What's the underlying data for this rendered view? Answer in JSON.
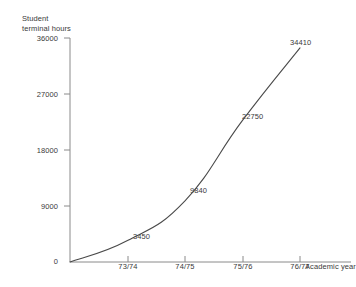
{
  "chart_data": {
    "type": "line",
    "title": "",
    "xlabel": "Academic year",
    "ylabel": "Student\nterminal hours",
    "categories": [
      "",
      "73/74",
      "74/75",
      "75/76",
      "76/77"
    ],
    "x": [
      "72/73",
      "73/74",
      "74/75",
      "75/76",
      "76/77"
    ],
    "values": [
      0,
      3450,
      9840,
      22750,
      34410
    ],
    "point_labels": [
      "0",
      "3450",
      "9840",
      "22750",
      "34410"
    ],
    "ylim": [
      0,
      36000
    ],
    "y_ticks": [
      0,
      9000,
      18000,
      27000,
      36000
    ],
    "y_tick_labels": [
      "0",
      "9000",
      "18000",
      "27000",
      "36000"
    ],
    "x_tick_labels": [
      "73/74",
      "74/75",
      "75/76",
      "76/77"
    ],
    "grid": false,
    "legend": false,
    "series": [
      {
        "name": "Student terminal hours",
        "values": [
          0,
          3450,
          9840,
          22750,
          34410
        ]
      }
    ],
    "line_color": "#4a4a4a",
    "axis_color": "#8a8a8a",
    "text_color": "#3a3a3a"
  },
  "y_axis": {
    "title_line1": "Student",
    "title_line2": "terminal hours",
    "title": "Student\nterminal hours",
    "ticks": [
      {
        "label": "36000"
      },
      {
        "label": "27000"
      },
      {
        "label": "18000"
      },
      {
        "label": "9000"
      },
      {
        "label": "0"
      }
    ]
  },
  "x_axis": {
    "title": "Academic year",
    "ticks": [
      {
        "label": "73/74"
      },
      {
        "label": "74/75"
      },
      {
        "label": "75/76"
      },
      {
        "label": "76/77"
      }
    ]
  },
  "data_point_labels": [
    {
      "label": "3450"
    },
    {
      "label": "9840"
    },
    {
      "label": "22750"
    },
    {
      "label": "34410"
    }
  ]
}
